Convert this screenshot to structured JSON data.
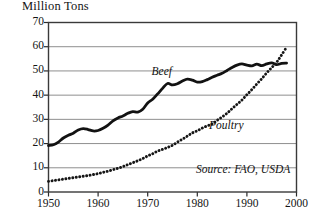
{
  "chart_data": {
    "type": "line",
    "title": "Million Tons",
    "xlabel": "",
    "ylabel": "Million Tons",
    "xlim": [
      1950,
      2000
    ],
    "ylim": [
      0,
      70
    ],
    "grid": true,
    "grid_axis": "y",
    "legend_position": "inline-annotations",
    "xticks": [
      "1950",
      "1960",
      "1970",
      "1980",
      "1990",
      "2000"
    ],
    "xtick_values": [
      1950,
      1960,
      1970,
      1980,
      1990,
      2000
    ],
    "yticks": [
      "0",
      "10",
      "20",
      "30",
      "40",
      "50",
      "60",
      "70"
    ],
    "ytick_values": [
      0,
      10,
      20,
      30,
      40,
      50,
      60,
      70
    ],
    "annotations": [
      {
        "text": "Beef",
        "x": 1974,
        "y": 49,
        "style": "italic"
      },
      {
        "text": "Poultry",
        "x": 1986,
        "y": 27,
        "style": "italic"
      },
      {
        "text": "Source: FAO, USDA",
        "x": 1990,
        "y": 6,
        "style": "italic"
      }
    ],
    "source": "Source: FAO, USDA",
    "series": [
      {
        "name": "Beef",
        "style": "solid",
        "color": "#121212",
        "width": 2.8,
        "x": [
          1950,
          1951,
          1952,
          1953,
          1954,
          1955,
          1956,
          1957,
          1958,
          1959,
          1960,
          1961,
          1962,
          1963,
          1964,
          1965,
          1966,
          1967,
          1968,
          1969,
          1970,
          1971,
          1972,
          1973,
          1974,
          1975,
          1976,
          1977,
          1978,
          1979,
          1980,
          1981,
          1982,
          1983,
          1984,
          1985,
          1986,
          1987,
          1988,
          1989,
          1990,
          1991,
          1992,
          1993,
          1994,
          1995,
          1996,
          1997,
          1998
        ],
        "values": [
          19.2,
          19.5,
          20.6,
          22.3,
          23.4,
          24.3,
          25.6,
          26.2,
          25.8,
          25.2,
          25.4,
          26.3,
          27.6,
          29.4,
          30.6,
          31.4,
          32.5,
          33.2,
          33.0,
          34.2,
          36.8,
          38.3,
          40.5,
          42.8,
          44.8,
          44.2,
          44.7,
          45.8,
          46.6,
          46.2,
          45.4,
          45.6,
          46.4,
          47.4,
          48.2,
          49.0,
          50.2,
          51.4,
          52.4,
          52.9,
          52.4,
          52.1,
          52.8,
          52.2,
          52.9,
          53.3,
          52.6,
          53.1,
          53.2
        ]
      },
      {
        "name": "Poultry",
        "style": "dotted",
        "color": "#161616",
        "width": 2.6,
        "x": [
          1950,
          1951,
          1952,
          1953,
          1954,
          1955,
          1956,
          1957,
          1958,
          1959,
          1960,
          1961,
          1962,
          1963,
          1964,
          1965,
          1966,
          1967,
          1968,
          1969,
          1970,
          1971,
          1972,
          1973,
          1974,
          1975,
          1976,
          1977,
          1978,
          1979,
          1980,
          1981,
          1982,
          1983,
          1984,
          1985,
          1986,
          1987,
          1988,
          1989,
          1990,
          1991,
          1992,
          1993,
          1994,
          1995,
          1996,
          1997,
          1998
        ],
        "values": [
          4.4,
          4.7,
          5.0,
          5.3,
          5.6,
          5.9,
          6.2,
          6.5,
          6.8,
          7.2,
          7.6,
          8.1,
          8.6,
          9.2,
          9.8,
          10.5,
          11.3,
          12.1,
          12.9,
          13.8,
          14.9,
          15.8,
          16.9,
          17.6,
          18.4,
          19.3,
          20.6,
          21.8,
          23.1,
          24.4,
          25.3,
          26.4,
          27.3,
          28.1,
          29.6,
          31.0,
          32.5,
          34.4,
          36.2,
          38.0,
          40.2,
          42.3,
          44.6,
          46.8,
          49.2,
          51.4,
          53.6,
          56.6,
          59.8
        ]
      }
    ]
  }
}
